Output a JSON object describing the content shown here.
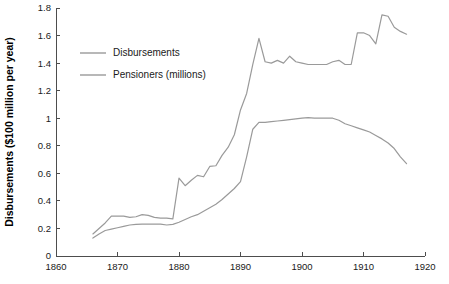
{
  "chart_data": {
    "type": "line",
    "title": "",
    "xlabel": "",
    "ylabel": "Disbursements ($100 million per year)",
    "xlim": [
      1860,
      1920
    ],
    "ylim": [
      0,
      1.8
    ],
    "xticks": [
      1860,
      1870,
      1880,
      1890,
      1900,
      1910,
      1920
    ],
    "yticks": [
      0,
      0.2,
      0.4,
      0.6,
      0.8,
      1,
      1.2,
      1.4,
      1.6,
      1.8
    ],
    "xtick_labels": [
      "1860",
      "1870",
      "1880",
      "1890",
      "1900",
      "1910",
      "1920"
    ],
    "ytick_labels": [
      "0",
      "0.2",
      "0.4",
      "0.6",
      "0.8",
      "1",
      "1.2",
      "1.4",
      "1.6",
      "1.8"
    ],
    "grid": false,
    "legend_position": "upper-left-inside",
    "line_color": "#9a9a9a",
    "axis_color": "#4d4d4d",
    "x": [
      1866,
      1867,
      1868,
      1869,
      1870,
      1871,
      1872,
      1873,
      1874,
      1875,
      1876,
      1877,
      1878,
      1879,
      1880,
      1881,
      1882,
      1883,
      1884,
      1885,
      1886,
      1887,
      1888,
      1889,
      1890,
      1891,
      1892,
      1893,
      1894,
      1895,
      1896,
      1897,
      1898,
      1899,
      1900,
      1901,
      1902,
      1903,
      1904,
      1905,
      1906,
      1907,
      1908,
      1909,
      1910,
      1911,
      1912,
      1913,
      1914,
      1915,
      1916,
      1917
    ],
    "series": [
      {
        "name": "Disbursements",
        "values": [
          0.16,
          0.2,
          0.24,
          0.29,
          0.29,
          0.29,
          0.28,
          0.285,
          0.3,
          0.295,
          0.28,
          0.275,
          0.275,
          0.27,
          0.565,
          0.51,
          0.55,
          0.585,
          0.575,
          0.65,
          0.655,
          0.73,
          0.79,
          0.88,
          1.06,
          1.18,
          1.39,
          1.58,
          1.41,
          1.4,
          1.42,
          1.4,
          1.45,
          1.41,
          1.4,
          1.39,
          1.39,
          1.39,
          1.39,
          1.41,
          1.42,
          1.39,
          1.39,
          1.62,
          1.62,
          1.6,
          1.54,
          1.75,
          1.74,
          1.66,
          1.63,
          1.61
        ]
      },
      {
        "name": "Pensioners (millions)",
        "values": [
          0.13,
          0.16,
          0.185,
          0.195,
          0.205,
          0.215,
          0.225,
          0.23,
          0.232,
          0.232,
          0.232,
          0.232,
          0.225,
          0.23,
          0.245,
          0.265,
          0.285,
          0.3,
          0.325,
          0.35,
          0.375,
          0.41,
          0.45,
          0.49,
          0.54,
          0.72,
          0.92,
          0.97,
          0.97,
          0.975,
          0.98,
          0.985,
          0.99,
          0.995,
          1.0,
          1.005,
          1.0,
          1.0,
          1.0,
          1.0,
          0.985,
          0.96,
          0.945,
          0.93,
          0.915,
          0.9,
          0.875,
          0.85,
          0.82,
          0.78,
          0.72,
          0.67
        ]
      }
    ]
  },
  "legend": {
    "items": [
      {
        "label": "Disbursements",
        "color": "#9a9a9a"
      },
      {
        "label": "Pensioners (millions)",
        "color": "#9a9a9a"
      }
    ]
  }
}
